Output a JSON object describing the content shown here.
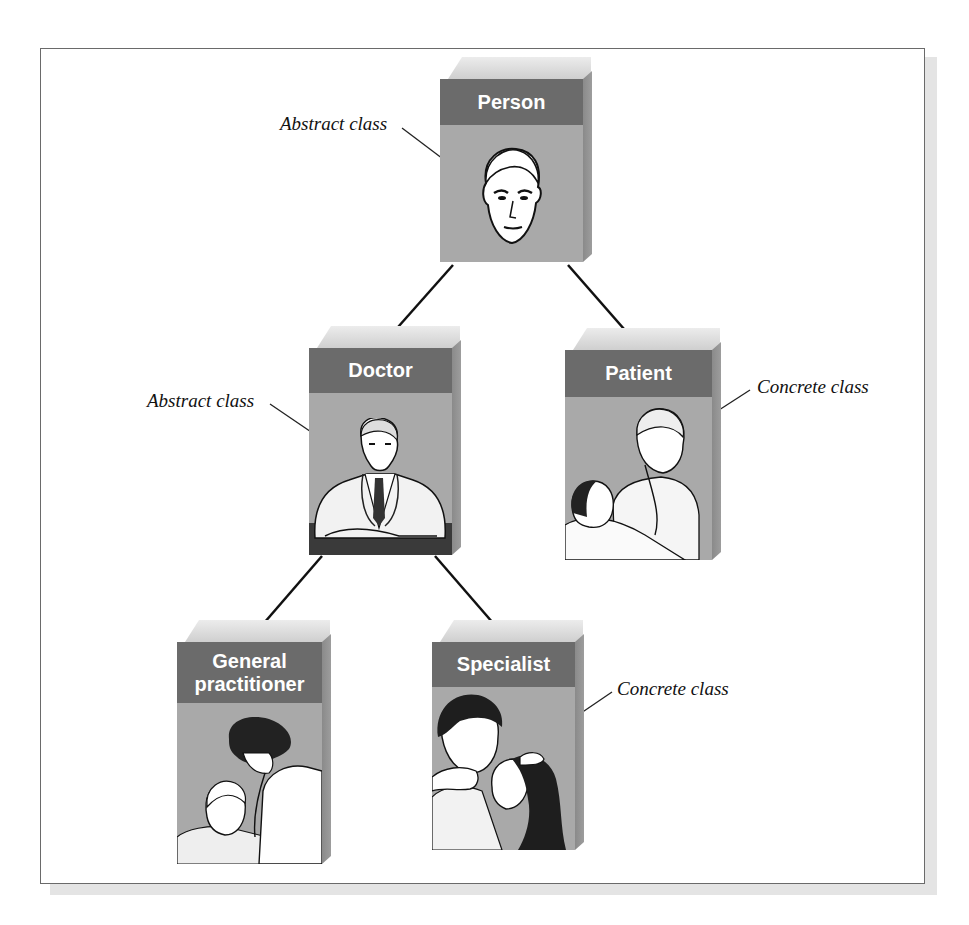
{
  "diagram": {
    "type": "class-hierarchy",
    "colors": {
      "header": "#6b6b6b",
      "body": "#a9a9a9",
      "side": "#8a8a8a",
      "top": "#dcdcdc",
      "line": "#111111"
    },
    "nodes": [
      {
        "id": "person",
        "title": "Person",
        "illustration": "man-face"
      },
      {
        "id": "doctor",
        "title": "Doctor",
        "illustration": "doctor-seated-at-desk"
      },
      {
        "id": "patient",
        "title": "Patient",
        "illustration": "doctor-examining-bedridden-patient"
      },
      {
        "id": "gp",
        "title_line1": "General",
        "title_line2": "practitioner",
        "illustration": "female-doctor-with-stethoscope-and-man"
      },
      {
        "id": "specialist",
        "title": "Specialist",
        "illustration": "doctor-examining-woman-eye"
      }
    ],
    "edges": [
      {
        "from": "Person",
        "to": "Doctor"
      },
      {
        "from": "Person",
        "to": "Patient"
      },
      {
        "from": "Doctor",
        "to": "General practitioner"
      },
      {
        "from": "Doctor",
        "to": "Specialist"
      }
    ],
    "annotations": [
      {
        "text": "Abstract class",
        "target": "Person"
      },
      {
        "text": "Abstract class",
        "target": "Doctor"
      },
      {
        "text": "Concrete class",
        "target": "Patient"
      },
      {
        "text": "Concrete class",
        "target": "Specialist"
      }
    ]
  }
}
